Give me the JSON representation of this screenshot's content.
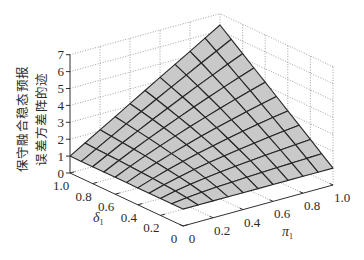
{
  "chart_data": {
    "type": "surface3d",
    "title": "",
    "xlabel": {
      "symbol": "π",
      "sub": "1"
    },
    "ylabel": {
      "symbol": "δ",
      "sub": "1"
    },
    "zlabel": [
      "保守融合稳态预报",
      "误差方差阵的迹"
    ],
    "x_name": "pi_1",
    "y_name": "delta_1",
    "x": [
      0,
      0.1,
      0.2,
      0.3,
      0.4,
      0.5,
      0.6,
      0.7,
      0.8,
      0.9,
      1.0
    ],
    "y": [
      0,
      0.1,
      0.2,
      0.3,
      0.4,
      0.5,
      0.6,
      0.7,
      0.8,
      0.9,
      1.0
    ],
    "z_rows_indexed_by": "y (delta_1)",
    "z": [
      [
        1.0,
        1.0,
        1.0,
        1.0,
        1.0,
        1.0,
        1.0,
        1.0,
        1.0,
        1.0,
        1.0
      ],
      [
        1.0,
        1.12,
        1.2,
        1.26,
        1.31,
        1.36,
        1.4,
        1.44,
        1.47,
        1.5,
        1.53
      ],
      [
        1.0,
        1.2,
        1.36,
        1.48,
        1.59,
        1.69,
        1.78,
        1.86,
        1.93,
        2.0,
        2.07
      ],
      [
        1.0,
        1.26,
        1.48,
        1.67,
        1.84,
        1.99,
        2.13,
        2.26,
        2.38,
        2.49,
        2.6
      ],
      [
        1.0,
        1.31,
        1.59,
        1.84,
        2.07,
        2.27,
        2.47,
        2.65,
        2.82,
        2.98,
        3.13
      ],
      [
        1.0,
        1.36,
        1.69,
        1.99,
        2.27,
        2.54,
        2.79,
        3.02,
        3.25,
        3.46,
        3.67
      ],
      [
        1.0,
        1.4,
        1.78,
        2.13,
        2.47,
        2.79,
        3.09,
        3.39,
        3.67,
        3.94,
        4.2
      ],
      [
        1.0,
        1.44,
        1.86,
        2.26,
        2.65,
        3.02,
        3.39,
        3.74,
        4.08,
        4.41,
        4.73
      ],
      [
        1.0,
        1.47,
        1.93,
        2.38,
        2.82,
        3.25,
        3.67,
        4.08,
        4.48,
        4.88,
        5.26
      ],
      [
        1.0,
        1.5,
        2.0,
        2.49,
        2.98,
        3.46,
        3.94,
        4.41,
        4.88,
        5.34,
        5.8
      ],
      [
        1.0,
        1.53,
        2.07,
        2.6,
        3.13,
        3.67,
        4.2,
        4.73,
        5.26,
        5.8,
        6.33
      ]
    ],
    "xticks": [
      {
        "value": 0,
        "label": "0"
      },
      {
        "value": 0.2,
        "label": "0.2"
      },
      {
        "value": 0.4,
        "label": "0.4"
      },
      {
        "value": 0.6,
        "label": "0.6"
      },
      {
        "value": 0.8,
        "label": "0.8"
      },
      {
        "value": 1.0,
        "label": "1.0"
      }
    ],
    "yticks": [
      {
        "value": 0,
        "label": "0"
      },
      {
        "value": 0.2,
        "label": "0.2"
      },
      {
        "value": 0.4,
        "label": "0.4"
      },
      {
        "value": 0.6,
        "label": "0.6"
      },
      {
        "value": 0.8,
        "label": "0.8"
      },
      {
        "value": 1.0,
        "label": "1.0"
      }
    ],
    "zticks": [
      {
        "value": 0,
        "label": "0"
      },
      {
        "value": 1,
        "label": "1"
      },
      {
        "value": 2,
        "label": "2"
      },
      {
        "value": 3,
        "label": "3"
      },
      {
        "value": 4,
        "label": "4"
      },
      {
        "value": 5,
        "label": "5"
      },
      {
        "value": 6,
        "label": "6"
      },
      {
        "value": 7,
        "label": "7"
      }
    ],
    "xlim": [
      0,
      1
    ],
    "ylim": [
      0,
      1
    ],
    "zlim": [
      0,
      7
    ],
    "grid": true,
    "legend": null
  },
  "style": {
    "surface_fill": "#c9c9c9",
    "mesh_color": "#262626",
    "grid_color": "#8a8a8a",
    "axis_color": "#303030"
  }
}
